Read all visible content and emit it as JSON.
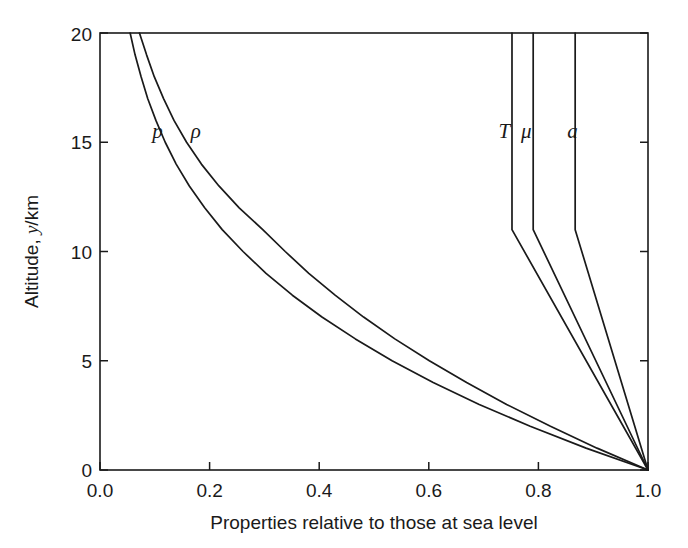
{
  "chart_data": {
    "type": "line",
    "title": "",
    "xlabel": "Properties relative to those at sea level",
    "ylabel": "Altitude, y/km",
    "ylabel_prefix": "Altitude, ",
    "ylabel_italic": "y",
    "ylabel_suffix": "/km",
    "xlim": [
      0.0,
      1.0
    ],
    "ylim": [
      0,
      20
    ],
    "grid": false,
    "legend": "inline-curve-labels",
    "xticks": [
      "0.0",
      "0.2",
      "0.4",
      "0.6",
      "0.8",
      "1.0"
    ],
    "xtick_values": [
      0.0,
      0.2,
      0.4,
      0.6,
      0.8,
      1.0
    ],
    "yticks": [
      "0",
      "5",
      "10",
      "15",
      "20"
    ],
    "ytick_values": [
      0,
      5,
      10,
      15,
      20
    ],
    "series": [
      {
        "name": "p",
        "label": "p",
        "description": "pressure relative to sea level",
        "color": "#1a1a1a",
        "label_x": 0.105,
        "label_y": 15.2,
        "y": [
          0,
          1,
          2,
          3,
          4,
          5,
          6,
          7,
          8,
          9,
          10,
          11,
          12,
          13,
          14,
          15,
          16,
          17,
          18,
          19,
          20
        ],
        "values": [
          1.0,
          0.887,
          0.785,
          0.692,
          0.608,
          0.533,
          0.466,
          0.405,
          0.351,
          0.303,
          0.261,
          0.223,
          0.191,
          0.163,
          0.139,
          0.119,
          0.102,
          0.087,
          0.075,
          0.064,
          0.055
        ]
      },
      {
        "name": "rho",
        "label": "ρ",
        "description": "density relative to sea level",
        "color": "#1a1a1a",
        "label_x": 0.175,
        "label_y": 15.2,
        "y": [
          0,
          1,
          2,
          3,
          4,
          5,
          6,
          7,
          8,
          9,
          10,
          11,
          12,
          13,
          14,
          15,
          16,
          17,
          18,
          19,
          20
        ],
        "values": [
          1.0,
          0.907,
          0.822,
          0.742,
          0.669,
          0.601,
          0.538,
          0.481,
          0.429,
          0.381,
          0.338,
          0.297,
          0.254,
          0.217,
          0.185,
          0.158,
          0.135,
          0.116,
          0.099,
          0.085,
          0.072
        ]
      },
      {
        "name": "T",
        "label": "T",
        "description": "temperature relative to sea level",
        "color": "#1a1a1a",
        "label_x": 0.738,
        "label_y": 15.2,
        "y": [
          0,
          11,
          20
        ],
        "values": [
          1.0,
          0.7518,
          0.7518
        ]
      },
      {
        "name": "mu",
        "label": "μ",
        "description": "dynamic viscosity relative to sea level",
        "color": "#1a1a1a",
        "label_x": 0.778,
        "label_y": 15.2,
        "y": [
          0,
          11,
          20
        ],
        "values": [
          1.0,
          0.7905,
          0.7905
        ]
      },
      {
        "name": "a",
        "label": "a",
        "description": "speed of sound relative to sea level",
        "color": "#1a1a1a",
        "label_x": 0.862,
        "label_y": 15.2,
        "y": [
          0,
          11,
          20
        ],
        "values": [
          1.0,
          0.8671,
          0.8671
        ]
      }
    ]
  }
}
